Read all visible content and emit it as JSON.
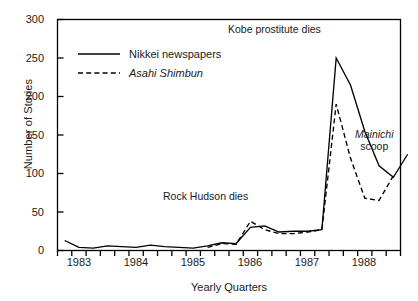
{
  "chart_data": {
    "type": "line",
    "title": "",
    "xlabel": "Yearly Quarters",
    "ylabel": "Number of Stories",
    "ylim": [
      0,
      300
    ],
    "yticks": [
      0,
      50,
      100,
      150,
      200,
      250,
      300
    ],
    "ytick_labels": [
      "0",
      "50",
      "100",
      "150",
      "200",
      "250",
      "300"
    ],
    "xtick_labels": [
      "1983",
      "1984",
      "1985",
      "1986",
      "1987",
      "1988"
    ],
    "x_quarter_count": 24,
    "grid": false,
    "legend_position": "upper-left-inside",
    "series": [
      {
        "name": "Nikkei newspapers",
        "style": "solid",
        "color": "#000000",
        "x": [
          1,
          2,
          3,
          4,
          5,
          6,
          7,
          8,
          9,
          10,
          11,
          12,
          13,
          14,
          15,
          16,
          17,
          18,
          19,
          20,
          21,
          22,
          23,
          24
        ],
        "values": [
          13,
          4,
          3,
          6,
          5,
          4,
          7,
          5,
          4,
          3,
          6,
          10,
          9,
          30,
          32,
          24,
          25,
          25,
          27,
          250,
          215,
          155,
          110,
          95
        ],
        "values_note": "last point rises to 125 at 1988 Q4",
        "values_full": [
          13,
          4,
          3,
          6,
          5,
          4,
          7,
          5,
          4,
          3,
          6,
          10,
          9,
          30,
          32,
          24,
          25,
          25,
          27,
          250,
          215,
          155,
          110,
          95,
          125
        ]
      },
      {
        "name": "Asahi Shimbun",
        "style": "dashed",
        "color": "#000000",
        "italic_label": true,
        "starts_at_quarter": 11,
        "x": [
          11,
          12,
          13,
          14,
          15,
          16,
          17,
          18,
          19,
          20,
          21,
          22,
          23,
          24
        ],
        "values": [
          4,
          9,
          8,
          38,
          27,
          22,
          22,
          24,
          27,
          190,
          120,
          68,
          65,
          97
        ]
      }
    ],
    "annotations": [
      {
        "text": "Kobe prostitute dies",
        "style": "regular"
      },
      {
        "text": "Rock Hudson dies",
        "style": "regular"
      },
      {
        "text": "Mainichi",
        "style": "italic"
      },
      {
        "text": "scoop",
        "style": "regular"
      }
    ]
  },
  "legend": {
    "items": [
      {
        "label": "Nikkei newspapers",
        "style": "solid",
        "italic": false
      },
      {
        "label": "Asahi Shimbun",
        "style": "dashed",
        "italic": true
      }
    ]
  },
  "annotations": {
    "kobe": "Kobe prostitute dies",
    "rock": "Rock Hudson dies",
    "mainichi_italic": "Mainichi",
    "mainichi_regular": "scoop"
  },
  "axes": {
    "ylabel": "Number of Stories",
    "xlabel": "Yearly Quarters",
    "yticks": [
      "300",
      "250",
      "200",
      "150",
      "100",
      "50",
      "0"
    ],
    "xticks": [
      "1983",
      "1984",
      "1985",
      "1986",
      "1987",
      "1988"
    ]
  },
  "colors": {
    "line": "#000000",
    "frame": "#000000",
    "background": "#ffffff"
  }
}
